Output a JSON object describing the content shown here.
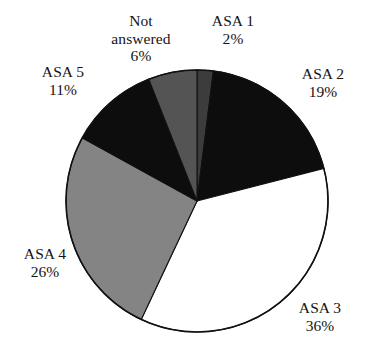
{
  "chart_data": {
    "type": "pie",
    "title": "",
    "subtitle": "",
    "xlabel": "",
    "ylabel": "",
    "legend_position": "none",
    "grid": false,
    "start_angle_deg": 0,
    "direction": "clockwise",
    "value_unit": "%",
    "categories": [
      "ASA 1",
      "ASA 2",
      "ASA 3",
      "ASA 4",
      "ASA 5",
      "Not answered"
    ],
    "values": [
      2,
      19,
      36,
      26,
      11,
      6
    ],
    "slices": [
      {
        "label": "ASA 1",
        "value": 2,
        "value_text": "2%",
        "color": "#3c3c3c"
      },
      {
        "label": "ASA 2",
        "value": 19,
        "value_text": "19%",
        "color": "#0d0d0d"
      },
      {
        "label": "ASA 3",
        "value": 36,
        "value_text": "36%",
        "color": "#ffffff"
      },
      {
        "label": "ASA 4",
        "value": 26,
        "value_text": "26%",
        "color": "#848484"
      },
      {
        "label": "ASA 5",
        "value": 11,
        "value_text": "11%",
        "color": "#0d0d0d"
      },
      {
        "label": "Not answered",
        "value": 6,
        "value_text": "6%",
        "color": "#545454"
      }
    ],
    "annotations": []
  },
  "labels": {
    "not_answered": {
      "name_line1": "Not",
      "name_line2": "answered",
      "pct": "6%"
    },
    "asa_1": {
      "name": "ASA 1",
      "pct": "2%"
    },
    "asa_2": {
      "name": "ASA 2",
      "pct": "19%"
    },
    "asa_3": {
      "name": "ASA 3",
      "pct": "36%"
    },
    "asa_4": {
      "name": "ASA 4",
      "pct": "26%"
    },
    "asa_5": {
      "name": "ASA 5",
      "pct": "11%"
    }
  },
  "colors": {
    "outline": "#111111",
    "background": "#ffffff",
    "text": "#141414",
    "black_slice": "#0d0d0d",
    "dark_gray_slice": "#3c3c3c",
    "mid_dark_gray_slice": "#545454",
    "mid_gray_slice": "#848484",
    "white_slice": "#ffffff"
  }
}
